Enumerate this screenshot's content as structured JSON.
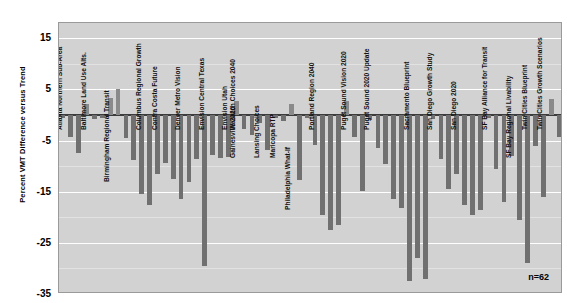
{
  "chart_data": {
    "type": "bar",
    "title": "",
    "xlabel": "",
    "ylabel": "Percent VMT Difference versus Trend",
    "ylim": [
      -35,
      18
    ],
    "yticks": [
      15,
      5,
      -5,
      -15,
      -25,
      -35
    ],
    "ytick_labels": [
      "15",
      "5",
      "-5",
      "-15",
      "-25",
      "-35"
    ],
    "minor_tick_step": 5,
    "grid": true,
    "legend": "none",
    "annotation": "n=62",
    "bar_color": "#7d7d7d",
    "plot_background": "#d2d2d2",
    "zero_line_color": "#3c3c3c",
    "n": 62,
    "group_labels": [
      "Atlanta Northern Sub-Area",
      "Baltimore Land Use Alts.",
      "Birmingham Regional Transit",
      "Columbus Regional Growth",
      "Contra Costa Future",
      "Denver Metro Vision",
      "Envision Central Texas",
      "Envision Utah",
      "Gainesville 2020",
      "Lansing Choices",
      "Maricopa RTP",
      "Philadelphia What-If",
      "Portland Region 2040",
      "Puget Sound Vision 2020",
      "Puget Sound 2020 Update",
      "Sacramento Blueprint",
      "San Diego Growth Study",
      "San Diego 2020",
      "SF Bay Alliance for Transit",
      "SF Bay Regional Livability",
      "Twin Cities Blueprint",
      "Twin Cities Growth Scenarios",
      "Wasatch Choices 2040"
    ],
    "values": [
      -0.6,
      -4.2,
      -7.5,
      2.2,
      -0.8,
      -0.5,
      3.4,
      5.0,
      -4.5,
      -8.8,
      -15.5,
      -17.5,
      -11.5,
      -9.3,
      -12.5,
      -16.4,
      -13.0,
      -8.6,
      -29.5,
      -7.8,
      -8.5,
      -8.2,
      2.8,
      -2.8,
      -4.0,
      -1.5,
      -6.8,
      -0.5,
      -1.2,
      2.2,
      -12.8,
      -0.5,
      -5.8,
      -19.5,
      -22.5,
      -21.5,
      2.8,
      -4.2,
      -14.8,
      -0.9,
      -6.5,
      -9.5,
      -16.5,
      -18.2,
      -32.5,
      -28.0,
      -32.0,
      -0.7,
      -8.6,
      -14.5,
      -11.5,
      -17.5,
      -19.5,
      -18.5,
      -0.5,
      -10.5,
      -17.0,
      -8.0,
      -20.5,
      -29.0,
      -6.0,
      -16.0,
      3.2,
      -4.2
    ]
  }
}
